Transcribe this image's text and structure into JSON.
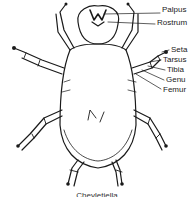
{
  "figure": {
    "caption": "Cheyletiella",
    "labels": [
      {
        "text": "Palpus",
        "x": 162,
        "y": 9
      },
      {
        "text": "Rostrum",
        "x": 157,
        "y": 20
      },
      {
        "text": "Seta",
        "x": 171,
        "y": 46
      },
      {
        "text": "Tarsus",
        "x": 163,
        "y": 56
      },
      {
        "text": "Tibia",
        "x": 167,
        "y": 66
      },
      {
        "text": "Genu",
        "x": 166,
        "y": 76
      },
      {
        "text": "Femur",
        "x": 163,
        "y": 85
      }
    ],
    "colors": {
      "ink": "#1a1a1a",
      "background": "#ffffff"
    }
  }
}
